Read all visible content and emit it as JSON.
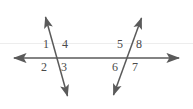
{
  "figure": {
    "background_color": "#ffffff",
    "line_color": "#5a5a5a",
    "label_color": "#4a4a4a",
    "lines": [
      {
        "name": "horizontal-line",
        "x1": 8,
        "y1": 58,
        "x2": 185,
        "y2": 58,
        "arrow_start": true,
        "arrow_end": true
      },
      {
        "name": "left-transversal",
        "x1": 44,
        "y1": 12,
        "x2": 69,
        "y2": 101,
        "arrow_start": true,
        "arrow_end": true
      },
      {
        "name": "right-transversal",
        "x1": 143,
        "y1": 13,
        "x2": 112,
        "y2": 100,
        "arrow_start": true,
        "arrow_end": true
      }
    ],
    "intersections": [
      {
        "name": "left-intersection",
        "x": 57,
        "y": 58
      },
      {
        "name": "right-intersection",
        "x": 131,
        "y": 58
      }
    ],
    "angle_labels": [
      {
        "id": "angle-1",
        "text": "1",
        "x": 43,
        "y": 44
      },
      {
        "id": "angle-4",
        "text": "4",
        "x": 62,
        "y": 44
      },
      {
        "id": "angle-2",
        "text": "2",
        "x": 41,
        "y": 62
      },
      {
        "id": "angle-3",
        "text": "3",
        "x": 61,
        "y": 62
      },
      {
        "id": "angle-5",
        "text": "5",
        "x": 117,
        "y": 44
      },
      {
        "id": "angle-8",
        "text": "8",
        "x": 135,
        "y": 44
      },
      {
        "id": "angle-6",
        "text": "6",
        "x": 112,
        "y": 62
      },
      {
        "id": "angle-7",
        "text": "7",
        "x": 132,
        "y": 62
      }
    ]
  }
}
